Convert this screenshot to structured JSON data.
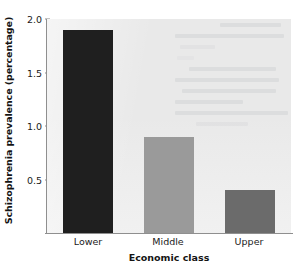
{
  "chart_data": {
    "type": "bar",
    "title": "",
    "xlabel": "Economic class",
    "ylabel": "Schizophrenia prevalence (percentage)",
    "categories": [
      "Lower",
      "Middle",
      "Upper"
    ],
    "values": [
      1.9,
      0.9,
      0.4
    ],
    "series": [
      {
        "name": "Schizophrenia prevalence",
        "values": [
          1.9,
          0.9,
          0.4
        ]
      }
    ],
    "ylim": [
      0,
      2.0
    ],
    "yticks": [
      0.5,
      1.0,
      1.5,
      2.0
    ],
    "ytick_labels": [
      "0.5",
      "1.0",
      "1.5",
      "2.0"
    ],
    "grid": false,
    "legend": false,
    "legend_position": "none",
    "bar_colors": [
      "#1f1f1f",
      "#9a9a9a",
      "#6b6b6b"
    ],
    "plot_background": "#e9e9e9",
    "axis_color": "#8f8f8f",
    "text_color": "#1a1a1a"
  },
  "axes": {
    "y_title": "Schizophrenia prevalence (percentage)",
    "x_title": "Economic class",
    "y_ticks": [
      {
        "label": "2.0",
        "value": 2.0
      },
      {
        "label": "1.5",
        "value": 1.5
      },
      {
        "label": "1.0",
        "value": 1.0
      },
      {
        "label": "0.5",
        "value": 0.5
      }
    ],
    "x_ticks": [
      {
        "label": "Lower"
      },
      {
        "label": "Middle"
      },
      {
        "label": "Upper"
      }
    ]
  }
}
